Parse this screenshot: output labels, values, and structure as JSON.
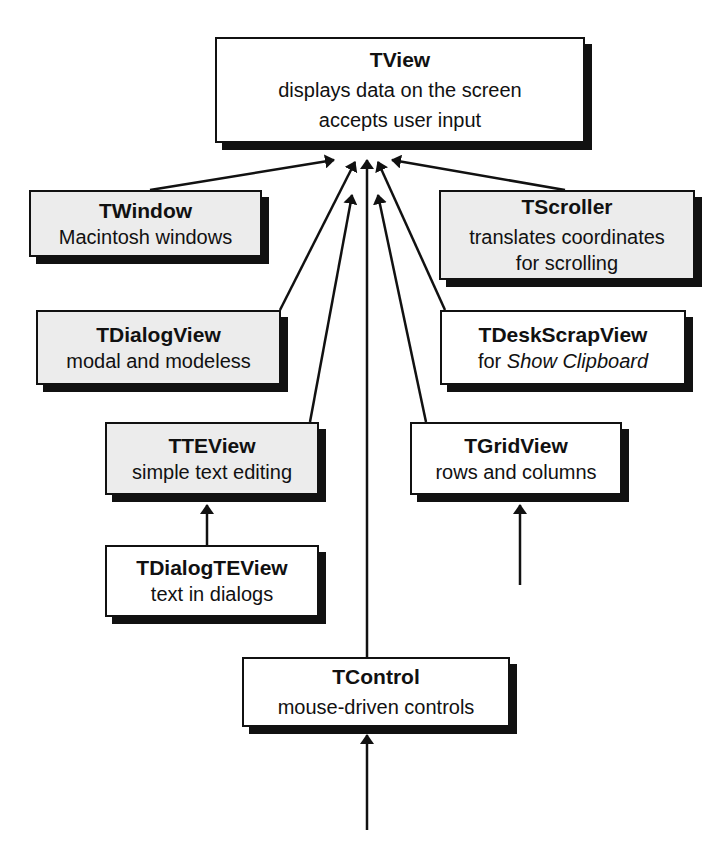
{
  "diagram": {
    "colors": {
      "stroke": "#111111",
      "grey_fill": "#ececec",
      "white_fill": "#ffffff"
    },
    "nodes": {
      "tview": {
        "title": "TView",
        "lines": [
          "displays data on the screen",
          "accepts user input"
        ]
      },
      "twindow": {
        "title": "TWindow",
        "lines": [
          "Macintosh windows"
        ]
      },
      "tscroller": {
        "title": "TScroller",
        "lines": [
          "translates coordinates",
          "for scrolling"
        ]
      },
      "tdialogview": {
        "title": "TDialogView",
        "lines": [
          "modal and modeless"
        ]
      },
      "tdeskscrapview": {
        "title": "TDeskScrapView",
        "line_prefix": "for ",
        "line_italic": "Show Clipboard"
      },
      "tteview": {
        "title": "TTEView",
        "lines": [
          "simple text editing"
        ]
      },
      "tgridview": {
        "title": "TGridView",
        "lines": [
          "rows and columns"
        ]
      },
      "tdialogteview": {
        "title": "TDialogTEView",
        "lines": [
          "text in dialogs"
        ]
      },
      "tcontrol": {
        "title": "TControl",
        "lines": [
          "mouse-driven controls"
        ]
      }
    },
    "edges": [
      {
        "from": "TWindow",
        "to": "TView"
      },
      {
        "from": "TScroller",
        "to": "TView"
      },
      {
        "from": "TDialogView",
        "to": "TView"
      },
      {
        "from": "TDeskScrapView",
        "to": "TView"
      },
      {
        "from": "TTEView",
        "to": "TView"
      },
      {
        "from": "TGridView",
        "to": "TView"
      },
      {
        "from": "TControl",
        "to": "TView"
      },
      {
        "from": "TDialogTEView",
        "to": "TTEView"
      },
      {
        "from": "(subclass)",
        "to": "TGridView"
      },
      {
        "from": "(subclass)",
        "to": "TControl"
      }
    ]
  }
}
